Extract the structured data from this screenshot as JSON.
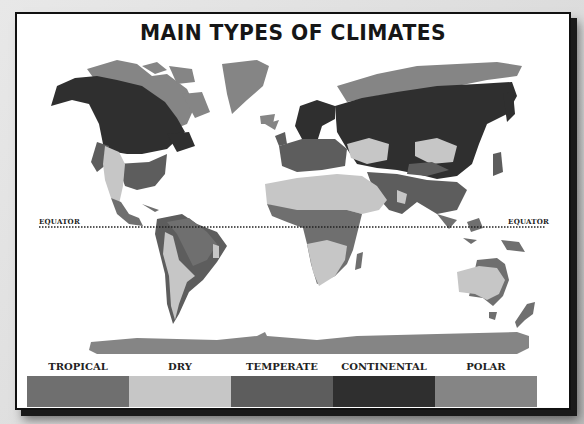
{
  "title": "MAIN TYPES OF CLIMATES",
  "equator": {
    "left_label": "EQUATOR",
    "right_label": "EQUATOR"
  },
  "legend": [
    {
      "label": "TROPICAL",
      "color": "#6f6f6f"
    },
    {
      "label": "DRY",
      "color": "#c6c6c6"
    },
    {
      "label": "TEMPERATE",
      "color": "#5d5d5d"
    },
    {
      "label": "CONTINENTAL",
      "color": "#2f2f2f"
    },
    {
      "label": "POLAR",
      "color": "#858585"
    }
  ],
  "colors": {
    "tropical": "#6f6f6f",
    "dry": "#c6c6c6",
    "temperate": "#5d5d5d",
    "continental": "#2f2f2f",
    "polar": "#858585"
  }
}
